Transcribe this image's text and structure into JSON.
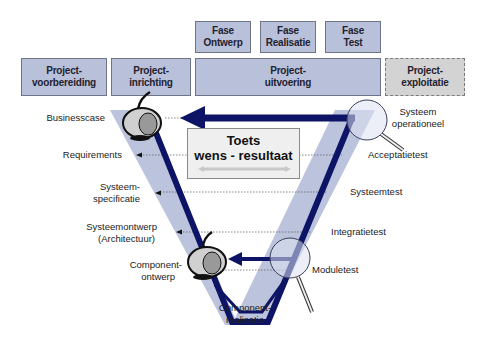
{
  "phases_top": [
    {
      "line1": "Fase",
      "line2": "Ontwerp"
    },
    {
      "line1": "Fase",
      "line2": "Realisatie"
    },
    {
      "line1": "Fase",
      "line2": "Test"
    }
  ],
  "project_stages": [
    {
      "line1": "Project-",
      "line2": "voorbereiding"
    },
    {
      "line1": "Project-",
      "line2": "inrichting"
    },
    {
      "line1": "Project-",
      "line2": "uitvoering"
    },
    {
      "line1": "Project-",
      "line2": "exploitatie"
    }
  ],
  "left_labels": {
    "businesscase": "Businesscase",
    "requirements": "Requirements",
    "systeemspec_1": "Systeem-",
    "systeemspec_2": "specificatie",
    "systeemontwerp_1": "Systeemontwerp",
    "systeemontwerp_2": "(Architectuur)",
    "componentontwerp_1": "Component-",
    "componentontwerp_2": "ontwerp"
  },
  "right_labels": {
    "systeem_operationeel_1": "Systeem",
    "systeem_operationeel_2": "operationeel",
    "acceptatietest": "Acceptatietest",
    "systeemtest": "Systeemtest",
    "integratietest": "Integratietest",
    "moduletest": "Moduletest"
  },
  "bottom_label": {
    "line1": "Component-",
    "line2": "realisatie"
  },
  "center_box": {
    "line1": "Toets",
    "line2": "wens - resultaat"
  },
  "colors": {
    "box_fill": "#b9c0d9",
    "box_border": "#6e7488",
    "exploitatie_fill": "#d3d3d3",
    "v_band": "#bcc3dc",
    "v_line": "#0d1466",
    "arrow": "#0d1466"
  },
  "icons": [
    "bomb-icon",
    "bomb-icon",
    "magnifier-icon",
    "magnifier-icon"
  ]
}
